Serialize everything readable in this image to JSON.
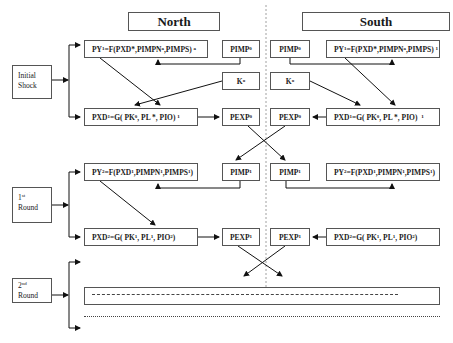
{
  "regions": {
    "north": "North",
    "south": "South"
  },
  "stages": {
    "initial": [
      "Initial",
      "Shock"
    ],
    "first": {
      "num": "1",
      "sup": "st",
      "word": "Round"
    },
    "second": {
      "num": "2",
      "sup": "nd",
      "word": "Round"
    }
  },
  "north": {
    "py1": {
      "pre": "PY",
      "s1": "1",
      "mid": "=F(PXD*,PIMPN",
      "s2": "a",
      "post": " ,PIMPS)",
      "s3": "a"
    },
    "pimp0": {
      "base": "PIMP",
      "sup": "0"
    },
    "k0": {
      "base": "K",
      "sup": "o"
    },
    "pxd1": {
      "pre": "PXD",
      "s1": "1",
      "mid": "=G( PK",
      "s2": "0",
      "post": ", PL *, PIO)",
      "s3": "1"
    },
    "pexp0": {
      "base": "PEXP",
      "sup": "0"
    },
    "py2": {
      "pre": "PY",
      "s1": "2",
      "mid": "=F(PXD",
      "s2": "1",
      "mid2": ",PIMPN",
      "s3": "1",
      "post": ",PIMPS",
      "s4": "1",
      "end": ")"
    },
    "pimp1": {
      "base": "PIMP",
      "sup": "1"
    },
    "pxd2": {
      "pre": "PXD",
      "s1": "2",
      "mid": "=G( PK",
      "s2": "1",
      "mid2": ", PL",
      "s3": "1",
      "post": ", PIO",
      "s4": "2",
      "end": ")"
    },
    "pexp1": {
      "base": "PEXP",
      "sup": "1"
    }
  },
  "south": {
    "pimp0": {
      "base": "PIMP",
      "sup": "0"
    },
    "py1": {
      "pre": "PY",
      "s1": "1",
      "mid": "=F(PXD*,PIMPN",
      "s2": "a",
      "post": ",PIMPS)",
      "s3": "1"
    },
    "k0": {
      "base": "K",
      "sup": "o"
    },
    "pexp0": {
      "base": "PEXP",
      "sup": "0"
    },
    "pxd1": {
      "pre": "PXD",
      "s1": "1",
      "mid": "=G( PK",
      "s2": "0",
      "post": ", PL *, PIO)",
      "s3": "1"
    },
    "pimp1": {
      "base": "PIMP",
      "sup": "1"
    },
    "py2": {
      "pre": "PY",
      "s1": "2",
      "mid": "=F(PXD",
      "s2": "1",
      "mid2": ",PIMPN",
      "s3": "1",
      "post": ",PIMPS",
      "s4": "1",
      "end": ")"
    },
    "pexp1": {
      "base": "PEXP",
      "sup": "1"
    },
    "pxd2": {
      "pre": "PXD",
      "s1": "2",
      "mid": "=G( PK",
      "s2": "1",
      "mid2": ", PL",
      "s3": "1",
      "post": ", PIO",
      "s4": "2",
      "end": ")"
    }
  }
}
